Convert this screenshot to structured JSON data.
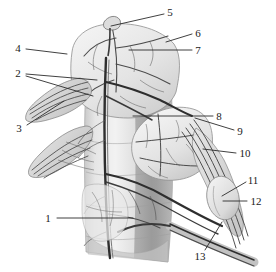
{
  "figure": {
    "width": 276,
    "height": 272,
    "background_color": "#ffffff",
    "ink_color": "#3c3c3c",
    "dark_ink_color": "#1f1f1f",
    "leader_color": "#2b2b2b",
    "tissue_light": "#ededed",
    "tissue_mid": "#d8d8d8",
    "tissue_dark": "#b9b9b9",
    "shadow": "#9a9a9a"
  },
  "labels": [
    {
      "id": "label-1",
      "text": "1",
      "x": 48,
      "y": 218,
      "leader": {
        "x1": 57,
        "y1": 218,
        "x2": 133,
        "y2": 218
      }
    },
    {
      "id": "label-2",
      "text": "2",
      "x": 18,
      "y": 73,
      "leader": {
        "x1": 26,
        "y1": 74,
        "x2": 97,
        "y2": 80
      }
    },
    {
      "id": "label-2b",
      "text": "",
      "x": 0,
      "y": 0,
      "leader": {
        "x1": 26,
        "y1": 76,
        "x2": 93,
        "y2": 96
      }
    },
    {
      "id": "label-3",
      "text": "3",
      "x": 19,
      "y": 128,
      "leader": {
        "x1": 27,
        "y1": 125,
        "x2": 64,
        "y2": 101
      }
    },
    {
      "id": "label-4",
      "text": "4",
      "x": 18,
      "y": 48,
      "leader": {
        "x1": 26,
        "y1": 49,
        "x2": 67,
        "y2": 54
      }
    },
    {
      "id": "label-5",
      "text": "5",
      "x": 170,
      "y": 12,
      "leader": {
        "x1": 164,
        "y1": 14,
        "x2": 111,
        "y2": 26
      }
    },
    {
      "id": "label-6",
      "text": "6",
      "x": 198,
      "y": 33,
      "leader": {
        "x1": 192,
        "y1": 34,
        "x2": 166,
        "y2": 42
      }
    },
    {
      "id": "label-7",
      "text": "7",
      "x": 198,
      "y": 50,
      "leader": {
        "x1": 192,
        "y1": 50,
        "x2": 129,
        "y2": 50
      }
    },
    {
      "id": "label-8",
      "text": "8",
      "x": 219,
      "y": 116,
      "leader": {
        "x1": 213,
        "y1": 116,
        "x2": 133,
        "y2": 116
      }
    },
    {
      "id": "label-9",
      "text": "9",
      "x": 240,
      "y": 131,
      "leader": {
        "x1": 234,
        "y1": 130,
        "x2": 195,
        "y2": 118
      }
    },
    {
      "id": "label-10",
      "text": "10",
      "x": 245,
      "y": 153,
      "leader": {
        "x1": 236,
        "y1": 153,
        "x2": 203,
        "y2": 149
      }
    },
    {
      "id": "label-11",
      "text": "11",
      "x": 253,
      "y": 180,
      "leader": {
        "x1": 246,
        "y1": 182,
        "x2": 222,
        "y2": 196
      }
    },
    {
      "id": "label-12",
      "text": "12",
      "x": 256,
      "y": 201,
      "leader": {
        "x1": 247,
        "y1": 201,
        "x2": 223,
        "y2": 201
      }
    },
    {
      "id": "label-13",
      "text": "13",
      "x": 200,
      "y": 256,
      "leader": {
        "x1": 205,
        "y1": 250,
        "x2": 222,
        "y2": 222
      }
    }
  ]
}
